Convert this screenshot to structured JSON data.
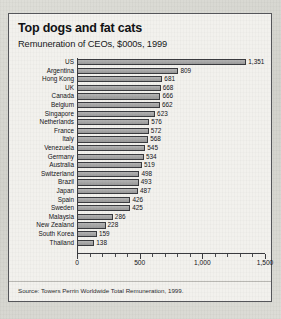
{
  "chart_data": {
    "type": "bar",
    "orientation": "horizontal",
    "title": "Top dogs and fat cats",
    "subtitle": "Remuneration of CEOs, $000s, 1999",
    "source": "Source: Towers Perrin Worldwide Total Remuneration, 1999.",
    "xlabel": "",
    "ylabel": "",
    "xlim": [
      0,
      1500
    ],
    "xticks": [
      0,
      500,
      1000,
      1500
    ],
    "xtick_labels": [
      "0",
      "500",
      "1,000",
      "1,500"
    ],
    "minor_tick_step": 100,
    "grid": false,
    "legend": false,
    "bar_color": "#a5a5a5",
    "bar_edge_color": "#3a3b3f",
    "categories": [
      "US",
      "Argentina",
      "Hong Kong",
      "UK",
      "Canada",
      "Belgium",
      "Singapore",
      "Netherlands",
      "France",
      "Italy",
      "Venezuela",
      "Germany",
      "Australia",
      "Switzerland",
      "Brazil",
      "Japan",
      "Spain",
      "Sweden",
      "Malaysia",
      "New Zealand",
      "South Korea",
      "Thailand"
    ],
    "values": [
      1351,
      809,
      681,
      668,
      666,
      662,
      623,
      576,
      572,
      568,
      545,
      534,
      519,
      498,
      493,
      487,
      426,
      425,
      286,
      228,
      159,
      138
    ],
    "value_labels": [
      "1,351",
      "809",
      "681",
      "668",
      "666",
      "662",
      "623",
      "576",
      "572",
      "568",
      "545",
      "534",
      "519",
      "498",
      "493",
      "487",
      "426",
      "425",
      "286",
      "228",
      "159",
      "138"
    ]
  }
}
